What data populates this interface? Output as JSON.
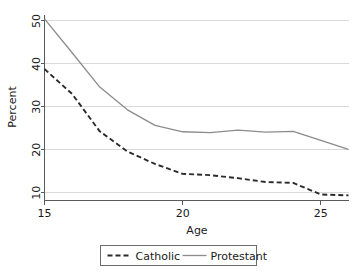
{
  "chart_data": {
    "type": "line",
    "title": "",
    "xlabel": "Age",
    "ylabel": "Percent",
    "xlim": [
      15,
      26
    ],
    "ylim": [
      8.2,
      51.5
    ],
    "xticks": [
      15,
      20,
      25
    ],
    "yticks": [
      10,
      20,
      30,
      40,
      50
    ],
    "xtick_labels": [
      "15",
      "20",
      "25"
    ],
    "ytick_labels": [
      "10",
      "20",
      "30",
      "40",
      "50"
    ],
    "grid": "horizontal",
    "legend_position": "below-center",
    "x": [
      15,
      16,
      17,
      18,
      19,
      20,
      21,
      22,
      23,
      24,
      25,
      26
    ],
    "series": [
      {
        "name": "Catholic",
        "style": "dashed",
        "color": "#2b2b2b",
        "values": [
          38.8,
          33.0,
          24.3,
          19.6,
          16.7,
          14.4,
          14.1,
          13.4,
          12.5,
          12.3,
          9.6,
          9.4
        ]
      },
      {
        "name": "Protestant",
        "style": "solid",
        "color": "#8c8c8c",
        "values": [
          50.5,
          42.6,
          34.6,
          29.3,
          25.7,
          24.2,
          24.0,
          24.6,
          24.1,
          24.3,
          22.2,
          20.1
        ]
      }
    ]
  },
  "legend": {
    "items": [
      {
        "label": "Catholic",
        "style": "dashed",
        "color": "#2b2b2b"
      },
      {
        "label": "Protestant",
        "style": "solid",
        "color": "#8c8c8c"
      }
    ]
  },
  "axes": {
    "x_title": "Age",
    "y_title": "Percent"
  }
}
